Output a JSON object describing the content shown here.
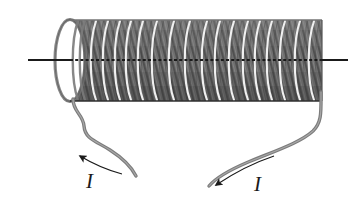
{
  "figure": {
    "kind": "physics-diagram",
    "width": 352,
    "height": 211,
    "background_color": "#ffffff"
  },
  "labels": {
    "current_left": "I",
    "current_right": "I"
  },
  "colors": {
    "coil_dark": "#6e6e6e",
    "coil_shadow": "#4f4f4f",
    "coil_highlight": "#f2f2f2",
    "wire": "#7a7a7a",
    "axis": "#1a1a1a",
    "arrow": "#1a1a1a",
    "background": "#ffffff"
  },
  "geometry": {
    "cylinder": {
      "left_x": 70,
      "right_x": 322,
      "top_y": 20,
      "bottom_y": 101,
      "cap_rx": 15,
      "cap_ry": 41,
      "center_y": 60.5
    },
    "axis_line": {
      "x1": 28,
      "x2": 348,
      "y": 60
    },
    "turn_count": 46,
    "highlight_arc_x": [
      92,
      104,
      116,
      127,
      139,
      153,
      170,
      186,
      203,
      216,
      230,
      244,
      256,
      268,
      281,
      296,
      310
    ],
    "lead_left": {
      "start": [
        73,
        99
      ],
      "path": "M 73 99 C 73 112, 83 114, 84 126 C 85 139, 96 141, 110 150 C 124 159, 131 166, 136 176"
    },
    "lead_right": {
      "start": [
        321,
        92
      ],
      "path": "M 321 92 C 321 112, 322 122, 313 131 C 300 143, 272 152, 246 163 C 225 172, 215 179, 209 186"
    },
    "arrow_left": {
      "tip": [
        71,
        153
      ],
      "angle_deg": 205,
      "tail_path": "M 120 173 C 105 169, 88 161, 78 155"
    },
    "arrow_right": {
      "tip": [
        211,
        188
      ],
      "angle_deg": 230,
      "tail_path": "M 272 157 C 252 164, 230 175, 216 185"
    }
  },
  "elements": {
    "coil_name": "solenoid-coil",
    "axis_name": "solenoid-axis-line",
    "left_lead_name": "lead-wire-left",
    "right_lead_name": "lead-wire-right",
    "left_arrow_name": "current-arrow-left",
    "right_arrow_name": "current-arrow-right"
  }
}
